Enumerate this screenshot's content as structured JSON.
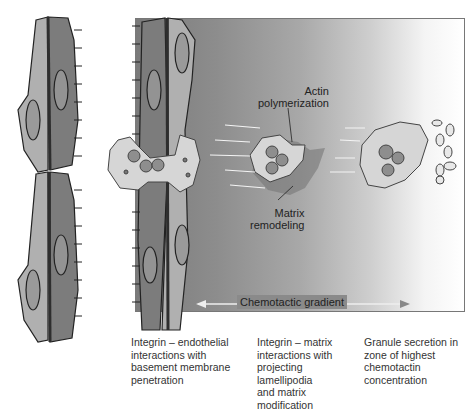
{
  "diagram": {
    "labels": {
      "actin": [
        "Actin",
        "polymerization"
      ],
      "matrix": [
        "Matrix",
        "remodeling"
      ],
      "gradient": "Chemotactic gradient"
    },
    "captions": [
      {
        "lines": [
          "Integrin – endothelial",
          "interactions with",
          "basement membrane",
          "penetration"
        ]
      },
      {
        "lines": [
          "Integrin – matrix",
          "interactions with",
          "projecting",
          "lamellipodia",
          "and matrix",
          "modification"
        ]
      },
      {
        "lines": [
          "Granule secretion in",
          "zone of highest",
          "chemotactin",
          "concentration"
        ]
      }
    ],
    "colors": {
      "cell_light": "#b0b0b0",
      "cell_dark": "#7c7c7c",
      "junction": "#2e2e2e",
      "leukocyte": "#d4d4d4"
    }
  }
}
